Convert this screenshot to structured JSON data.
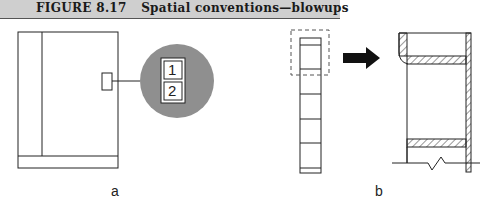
{
  "header": {
    "figure_number": "FIGURE 8.17",
    "title": "Spatial conventions—blowups"
  },
  "panels": [
    {
      "label": "a",
      "callout_numbers": [
        "1",
        "2"
      ]
    },
    {
      "label": "b"
    }
  ],
  "colors": {
    "header_bg": "#cfcfcf",
    "callout_circle": "#8f8f8f",
    "line": "#222222"
  }
}
